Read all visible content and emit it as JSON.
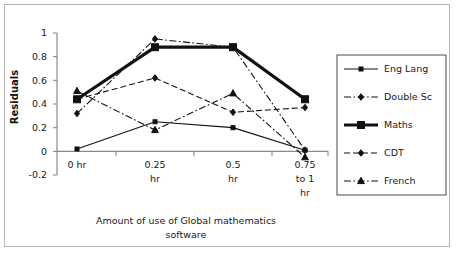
{
  "chart_data": {
    "type": "line",
    "title": "",
    "xlabel": "Amount of use of Global mathematics software",
    "ylabel": "Residuals",
    "categories": [
      "0 hr",
      "0.25 hr",
      "0.5 hr",
      "0.75 to 1 hr"
    ],
    "category_lines": [
      [
        "0 hr"
      ],
      [
        "0.25",
        "hr"
      ],
      [
        "0.5",
        "hr"
      ],
      [
        "0.75",
        "to 1",
        "hr"
      ]
    ],
    "ylim": [
      -0.2,
      1
    ],
    "yticks": [
      1,
      0.8,
      0.6,
      0.4,
      0.2,
      0,
      -0.2
    ],
    "ytick_labels": [
      "1",
      "0.8",
      "0.6",
      "0.4",
      "0.2",
      "0",
      "-0.2"
    ],
    "grid": false,
    "legend_position": "right",
    "series": [
      {
        "name": "Eng Lang",
        "values": [
          0.02,
          0.25,
          0.2,
          0.01
        ],
        "marker": "square",
        "line": "solid",
        "width": 1.1,
        "marker_size": 4.0
      },
      {
        "name": "Double Sc",
        "values": [
          0.32,
          0.95,
          0.88,
          0.01
        ],
        "marker": "diamond",
        "line": "dashdot",
        "width": 1.1,
        "marker_size": 4.6
      },
      {
        "name": "Maths",
        "values": [
          0.44,
          0.88,
          0.88,
          0.44
        ],
        "marker": "square",
        "line": "solid",
        "width": 3.2,
        "marker_size": 7.0
      },
      {
        "name": "CDT",
        "values": [
          0.44,
          0.62,
          0.33,
          0.37
        ],
        "marker": "diamond",
        "line": "dashed",
        "width": 1.1,
        "marker_size": 4.6
      },
      {
        "name": "French",
        "values": [
          0.51,
          0.18,
          0.49,
          -0.05
        ],
        "marker": "triangle",
        "line": "dashdot",
        "width": 1.1,
        "marker_size": 4.6
      }
    ]
  },
  "legend": {
    "items": [
      {
        "label": "Eng Lang"
      },
      {
        "label": "Double Sc"
      },
      {
        "label": "Maths"
      },
      {
        "label": "CDT"
      },
      {
        "label": "French"
      }
    ]
  },
  "colors": {
    "series": "#111111",
    "axis": "#8a8a8a",
    "frame": "#b4b4b4",
    "legend_border": "#4a4a4a",
    "text": "#1a1a1a"
  }
}
